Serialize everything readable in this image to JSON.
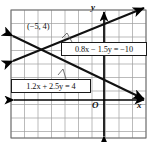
{
  "figure": {
    "background_color": "#ffffff",
    "grid": {
      "line_color": "#9a9a9a",
      "border_color": "#6e6e6e",
      "cell_size_px": 13.5,
      "left_px": 11,
      "top_px": 10,
      "right_px": 146,
      "bottom_px": 138,
      "columns": 10,
      "rows": 9.5
    },
    "axes": {
      "color": "#000000",
      "x_axis_label": "x",
      "y_axis_label": "y",
      "origin_label": "O",
      "x_axis_y_px": 100,
      "y_axis_x_px": 104,
      "x_axis_arrows": "both",
      "y_axis_arrows": "both"
    },
    "annotations": {
      "intersection_point_label": "(−5, 4)",
      "intersection_point_x": -5,
      "intersection_point_y": 4
    },
    "lines": [
      {
        "id": "line-1",
        "equation_label": "0.8x − 1.5y = −10",
        "coefficient_x": 0.8,
        "coefficient_y": -1.5,
        "constant": -10,
        "slope": 0.5333,
        "y_intercept": 6.667,
        "direction": "rising",
        "color": "#111111"
      },
      {
        "id": "line-2",
        "equation_label": "1.2x + 2.5y = 4",
        "coefficient_x": 1.2,
        "coefficient_y": 2.5,
        "constant": 4,
        "slope": -0.48,
        "y_intercept": 1.6,
        "direction": "falling",
        "color": "#111111"
      }
    ]
  }
}
